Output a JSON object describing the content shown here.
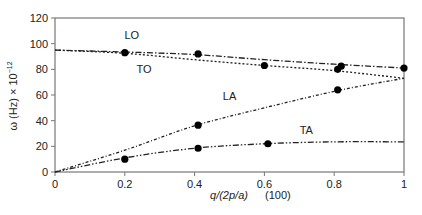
{
  "chart_data": {
    "type": "line",
    "title": "",
    "xlabel": "q/(2p/a)",
    "xlabel_secondary": "(100)",
    "ylabel": "ω (Hz) × 10",
    "ylabel_exponent": "−12",
    "xlim": [
      0,
      1
    ],
    "ylim": [
      0,
      120
    ],
    "x_ticks": [
      0,
      0.2,
      0.4,
      0.6,
      0.8,
      1
    ],
    "x_tick_labels": [
      "0",
      "0.2",
      "0.4",
      "0.6",
      "0.8",
      "1"
    ],
    "y_ticks": [
      0,
      20,
      40,
      60,
      80,
      100,
      120
    ],
    "y_tick_labels": [
      "0",
      "20",
      "40",
      "60",
      "80",
      "100",
      "120"
    ],
    "grid": false,
    "legend": "inline labels",
    "series": [
      {
        "name": "LO",
        "label_pos": [
          0.22,
          104
        ],
        "curve": [
          [
            0,
            95
          ],
          [
            0.2,
            93.5
          ],
          [
            0.4,
            91.5
          ],
          [
            0.6,
            87.5
          ],
          [
            0.8,
            84
          ],
          [
            1,
            81
          ]
        ],
        "points": [
          [
            0.2,
            93
          ],
          [
            0.41,
            92
          ],
          [
            0.82,
            82.5
          ],
          [
            1,
            81
          ]
        ]
      },
      {
        "name": "TO",
        "label_pos": [
          0.255,
          77
        ],
        "curve": [
          [
            0,
            95
          ],
          [
            0.2,
            92.5
          ],
          [
            0.4,
            87.5
          ],
          [
            0.6,
            83
          ],
          [
            0.8,
            79
          ],
          [
            1,
            73
          ]
        ],
        "points": [
          [
            0.6,
            83
          ],
          [
            0.81,
            80
          ]
        ]
      },
      {
        "name": "LA",
        "label_pos": [
          0.5,
          56
        ],
        "curve": [
          [
            0,
            0
          ],
          [
            0.2,
            17
          ],
          [
            0.4,
            36
          ],
          [
            0.6,
            50
          ],
          [
            0.82,
            64
          ],
          [
            1,
            73
          ]
        ],
        "points": [
          [
            0.41,
            36.5
          ],
          [
            0.81,
            64
          ]
        ]
      },
      {
        "name": "TA",
        "label_pos": [
          0.72,
          30
        ],
        "curve": [
          [
            0,
            0
          ],
          [
            0.2,
            11
          ],
          [
            0.4,
            18.5
          ],
          [
            0.6,
            22
          ],
          [
            0.8,
            23.5
          ],
          [
            1,
            23.5
          ]
        ],
        "points": [
          [
            0.2,
            10
          ],
          [
            0.41,
            18.5
          ],
          [
            0.61,
            22
          ]
        ]
      }
    ]
  }
}
